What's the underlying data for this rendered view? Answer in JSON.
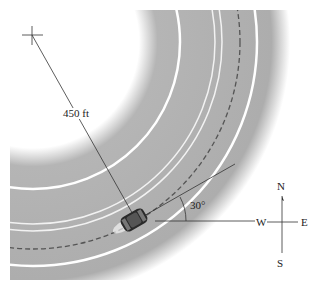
{
  "figure": {
    "radius_label": "450 ft",
    "angle_label": "30°",
    "compass": {
      "north": "N",
      "south": "S",
      "east": "E",
      "west": "W"
    },
    "colors": {
      "road": "#a9a9a9",
      "lane_lines": "#ffffff",
      "center_dash": "#555555",
      "lines": "#333333",
      "car": "#2a2a2a"
    }
  }
}
